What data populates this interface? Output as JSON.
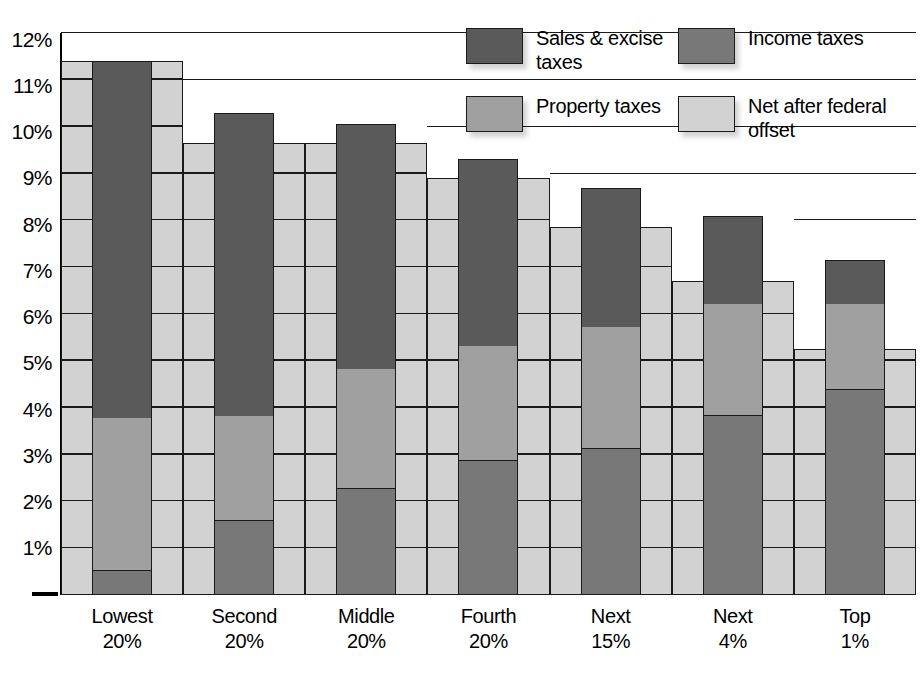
{
  "chart_data": {
    "type": "bar",
    "subtype": "stacked-bar-with-overlay",
    "title": "",
    "xlabel": "",
    "ylabel": "",
    "ylim": [
      0,
      12
    ],
    "ytick_labels": [
      "12%",
      "11%",
      "10%",
      "9%",
      "8%",
      "7%",
      "6%",
      "5%",
      "4%",
      "3%",
      "2%",
      "1%"
    ],
    "ytick_values": [
      12,
      11,
      10,
      9,
      8,
      7,
      6,
      5,
      4,
      3,
      2,
      1
    ],
    "grid": true,
    "legend_position": "top-right",
    "categories": [
      "Lowest 20%",
      "Second 20%",
      "Middle 20%",
      "Fourth 20%",
      "Next 15%",
      "Next 4%",
      "Top 1%"
    ],
    "series": [
      {
        "name": "Income taxes",
        "color": "#787878",
        "values": [
          0.5,
          1.55,
          2.25,
          2.85,
          3.1,
          3.8,
          4.35
        ]
      },
      {
        "name": "Property taxes",
        "color": "#a0a0a0",
        "values": [
          3.25,
          2.25,
          2.55,
          2.45,
          2.6,
          2.4,
          1.85
        ]
      },
      {
        "name": "Sales & excise taxes",
        "color": "#5a5a5a",
        "values": [
          7.65,
          6.5,
          5.25,
          4.0,
          3.0,
          1.9,
          0.95
        ]
      },
      {
        "name": "Net after federal offset",
        "color": "#d2d2d2",
        "values": [
          11.4,
          9.65,
          9.65,
          8.9,
          7.85,
          6.7,
          5.25
        ]
      }
    ],
    "totals": [
      11.4,
      10.3,
      10.05,
      9.3,
      8.7,
      8.1,
      7.15
    ],
    "segment_tops": {
      "income": [
        0.5,
        1.55,
        2.25,
        2.85,
        3.1,
        3.8,
        4.35
      ],
      "property": [
        3.75,
        3.8,
        4.8,
        5.3,
        5.7,
        6.2,
        6.2
      ],
      "sales": [
        11.4,
        10.3,
        10.05,
        9.3,
        8.7,
        8.1,
        7.15
      ]
    }
  },
  "legend": {
    "items": [
      {
        "label": "Sales & excise taxes",
        "color": "#5a5a5a"
      },
      {
        "label": "Income taxes",
        "color": "#787878"
      },
      {
        "label": "Property taxes",
        "color": "#a0a0a0"
      },
      {
        "label": "Net after federal offset",
        "color": "#d2d2d2"
      }
    ]
  },
  "axis": {
    "ticks": [
      "12%",
      "11%",
      "10%",
      "9%",
      "8%",
      "7%",
      "6%",
      "5%",
      "4%",
      "3%",
      "2%",
      "1%"
    ]
  },
  "xaxis": {
    "labels": [
      {
        "line1": "Lowest",
        "line2": "20%"
      },
      {
        "line1": "Second",
        "line2": "20%"
      },
      {
        "line1": "Middle",
        "line2": "20%"
      },
      {
        "line1": "Fourth",
        "line2": "20%"
      },
      {
        "line1": "Next",
        "line2": "15%"
      },
      {
        "line1": "Next",
        "line2": "4%"
      },
      {
        "line1": "Top",
        "line2": "1%"
      }
    ]
  }
}
